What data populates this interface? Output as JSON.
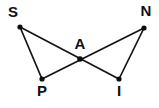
{
  "figure": {
    "background_color": "#ffffff",
    "stroke_color": "#141414",
    "label_color": "#111111",
    "width": 159,
    "height": 108,
    "points": [
      {
        "id": "S",
        "label": "S",
        "x": 20,
        "y": 27,
        "label_x": 13,
        "label_y": 13
      },
      {
        "id": "N",
        "label": "N",
        "x": 144,
        "y": 28,
        "label_x": 146,
        "label_y": 12
      },
      {
        "id": "A",
        "label": "A",
        "x": 80,
        "y": 59,
        "label_x": 80,
        "label_y": 45
      },
      {
        "id": "P",
        "label": "P",
        "x": 42,
        "y": 79,
        "label_x": 42,
        "label_y": 92
      },
      {
        "id": "I",
        "label": "I",
        "x": 119,
        "y": 79,
        "label_x": 119,
        "label_y": 92
      }
    ],
    "segments": [
      {
        "id": "S-I",
        "from": "S",
        "to": "I",
        "x1": 20,
        "y1": 27,
        "x2": 119,
        "y2": 79
      },
      {
        "id": "N-P",
        "from": "N",
        "to": "P",
        "x1": 144,
        "y1": 28,
        "x2": 42,
        "y2": 79
      },
      {
        "id": "S-P",
        "from": "S",
        "to": "P",
        "x1": 20,
        "y1": 27,
        "x2": 42,
        "y2": 79
      },
      {
        "id": "N-I",
        "from": "N",
        "to": "I",
        "x1": 144,
        "y1": 28,
        "x2": 119,
        "y2": 79
      }
    ]
  }
}
